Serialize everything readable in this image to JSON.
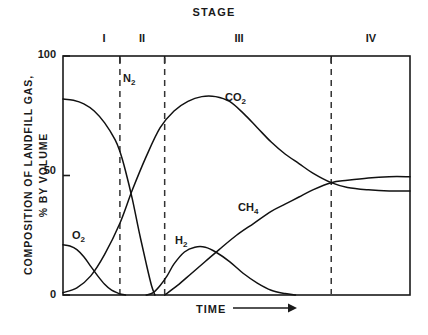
{
  "chart_data": {
    "type": "line",
    "title": "STAGE",
    "xlabel": "TIME",
    "ylabel": "COMPOSITION OF LANDFILL GAS, % BY VOLUME",
    "ylabel_line1": "COMPOSITION OF LANDFILL GAS,",
    "ylabel_line2": "% BY VOLUME",
    "ylim": [
      0,
      100
    ],
    "ytick_labels": [
      "100",
      "50",
      "0"
    ],
    "ytick_values": [
      100,
      50,
      0
    ],
    "xtick_labels": [],
    "grid": false,
    "legend": "inline-curve-labels",
    "axis_arrow": "→",
    "stages": [
      {
        "numeral": "I",
        "label": "I",
        "x_start_pct": 0,
        "x_end_pct": 16.4
      },
      {
        "numeral": "II",
        "label": "II",
        "x_start_pct": 16.4,
        "x_end_pct": 29.3
      },
      {
        "numeral": "III",
        "label": "III",
        "x_start_pct": 29.3,
        "x_end_pct": 77.3
      },
      {
        "numeral": "IV",
        "label": "IV",
        "x_start_pct": 77.3,
        "x_end_pct": 100
      }
    ],
    "stage_boundaries_pct": [
      16.4,
      29.3,
      77.3
    ],
    "series": [
      {
        "name": "N2",
        "label": "N₂",
        "points": [
          [
            0,
            82
          ],
          [
            3,
            81.5
          ],
          [
            6,
            80
          ],
          [
            9,
            77
          ],
          [
            12,
            72
          ],
          [
            15,
            65
          ],
          [
            16.4,
            60
          ],
          [
            18,
            52
          ],
          [
            20,
            40
          ],
          [
            22,
            26
          ],
          [
            24,
            13
          ],
          [
            25.5,
            4
          ],
          [
            26.5,
            0
          ]
        ]
      },
      {
        "name": "O2",
        "label": "O₂",
        "points": [
          [
            0,
            21
          ],
          [
            2,
            20.5
          ],
          [
            4,
            19
          ],
          [
            6,
            16
          ],
          [
            8,
            12
          ],
          [
            10,
            8
          ],
          [
            12,
            4.5
          ],
          [
            14,
            2
          ],
          [
            16,
            0.7
          ],
          [
            16.4,
            0.4
          ],
          [
            18,
            0
          ]
        ]
      },
      {
        "name": "CO2",
        "label": "CO₂",
        "points": [
          [
            0,
            1
          ],
          [
            4,
            3
          ],
          [
            8,
            8
          ],
          [
            12,
            17
          ],
          [
            16.4,
            30
          ],
          [
            20,
            44
          ],
          [
            24,
            58
          ],
          [
            28,
            70
          ],
          [
            32,
            77
          ],
          [
            36,
            81
          ],
          [
            40,
            83
          ],
          [
            44,
            83
          ],
          [
            48,
            81
          ],
          [
            52,
            76
          ],
          [
            56,
            70
          ],
          [
            60,
            64
          ],
          [
            64,
            59
          ],
          [
            68,
            55
          ],
          [
            72,
            51
          ],
          [
            77.3,
            47
          ],
          [
            82,
            45
          ],
          [
            88,
            44
          ],
          [
            94,
            43.5
          ],
          [
            100,
            43.5
          ]
        ]
      },
      {
        "name": "H2",
        "label": "H₂",
        "points": [
          [
            24,
            0
          ],
          [
            26,
            1
          ],
          [
            28,
            4
          ],
          [
            30,
            8
          ],
          [
            32,
            13
          ],
          [
            35,
            18
          ],
          [
            38,
            20
          ],
          [
            41,
            20
          ],
          [
            44,
            18
          ],
          [
            48,
            14
          ],
          [
            52,
            9
          ],
          [
            56,
            5
          ],
          [
            60,
            2
          ],
          [
            64,
            0.6
          ],
          [
            67,
            0
          ]
        ]
      },
      {
        "name": "CH4",
        "label": "CH₄",
        "points": [
          [
            29.3,
            0
          ],
          [
            33,
            4
          ],
          [
            37,
            9
          ],
          [
            41,
            14
          ],
          [
            45,
            19
          ],
          [
            50,
            25
          ],
          [
            55,
            30
          ],
          [
            60,
            35
          ],
          [
            64,
            38
          ],
          [
            68,
            41
          ],
          [
            72,
            44
          ],
          [
            77.3,
            47
          ],
          [
            82,
            48
          ],
          [
            88,
            49
          ],
          [
            94,
            49.5
          ],
          [
            100,
            49.5
          ]
        ]
      }
    ]
  },
  "curve_labels": {
    "n2": "N",
    "n2_sub": "2",
    "o2": "O",
    "o2_sub": "2",
    "co2": "CO",
    "co2_sub": "2",
    "h2": "H",
    "h2_sub": "2",
    "ch4": "CH",
    "ch4_sub": "4"
  },
  "axis": {
    "y_label_line1": "COMPOSITION OF LANDFILL GAS,",
    "y_label_line2": "% BY VOLUME",
    "y_tick_top": "100",
    "y_tick_mid": "50",
    "y_tick_bottom": "0",
    "x_label": "TIME",
    "x_arrow": "⟶"
  },
  "header": {
    "title": "STAGE"
  },
  "stage_numerals": {
    "s1": "I",
    "s2": "II",
    "s3": "III",
    "s4": "IV"
  },
  "colors": {
    "ink": "#1a1a1a",
    "background": "#ffffff",
    "curve": "#111111",
    "dashed": "#333333"
  }
}
